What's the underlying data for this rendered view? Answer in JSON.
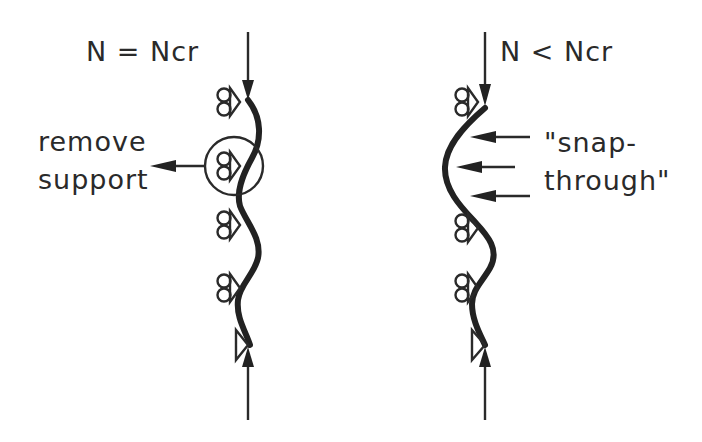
{
  "diagram": {
    "type": "structural buckling illustration",
    "colors": {
      "ink": "#222222",
      "background": "#ffffff"
    },
    "panels": [
      {
        "id": "left",
        "load_label": "N = Ncr",
        "annotation": {
          "line1": "remove",
          "line2": "support"
        },
        "supports": [
          "roller",
          "roller (circled)",
          "roller",
          "roller",
          "pin"
        ],
        "load_arrows": [
          "compressive load from top",
          "compressive load from bottom"
        ]
      },
      {
        "id": "right",
        "load_label": "N < Ncr",
        "annotation": {
          "line1": "\"snap-",
          "line2": "through\""
        },
        "supports": [
          "roller",
          "roller",
          "roller",
          "pin"
        ],
        "load_arrows": [
          "compressive load from top",
          "compressive load from bottom"
        ],
        "snap_arrows": 3
      }
    ]
  }
}
